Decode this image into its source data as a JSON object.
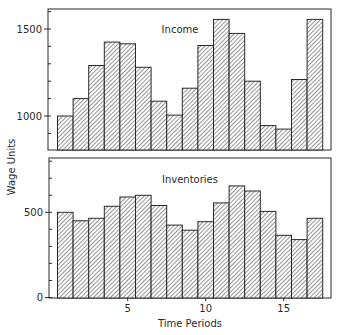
{
  "figure": {
    "ylabel": "Wage Units",
    "xlabel": "Time Periods"
  },
  "chart_data": [
    {
      "type": "bar",
      "title": "Income",
      "x": [
        1,
        2,
        3,
        4,
        5,
        6,
        7,
        8,
        9,
        10,
        11,
        12,
        13,
        14,
        15,
        16,
        17
      ],
      "values": [
        1000,
        1100,
        1290,
        1425,
        1415,
        1280,
        1085,
        1005,
        1160,
        1405,
        1555,
        1475,
        1200,
        945,
        925,
        1210,
        1555
      ],
      "xlabel": "",
      "ylabel": "Wage Units",
      "ylim": [
        805,
        1610
      ],
      "yticks_major": [
        1000,
        1500
      ],
      "yticks_minor_step": 100,
      "xticks": [],
      "grid": false,
      "fill": "diagonal hatch"
    },
    {
      "type": "bar",
      "title": "Inventories",
      "x": [
        1,
        2,
        3,
        4,
        5,
        6,
        7,
        8,
        9,
        10,
        11,
        12,
        13,
        14,
        15,
        16,
        17
      ],
      "values": [
        500,
        450,
        465,
        535,
        590,
        600,
        540,
        425,
        395,
        445,
        555,
        655,
        625,
        505,
        365,
        340,
        465
      ],
      "xlabel": "Time Periods",
      "ylabel": "Wage Units",
      "ylim": [
        0,
        820
      ],
      "yticks_major": [
        0,
        500
      ],
      "yticks_minor_step": 100,
      "xticks": [
        5,
        10,
        15
      ],
      "grid": false,
      "fill": "diagonal hatch"
    }
  ],
  "colors": {
    "ink": "#2a2a2a",
    "background": "#ffffff"
  }
}
